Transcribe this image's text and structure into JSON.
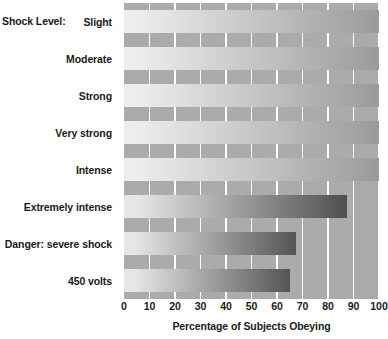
{
  "chart_data": {
    "type": "bar",
    "orientation": "horizontal",
    "title": "",
    "xlabel": "Percentage of Subjects Obeying",
    "ylabel": "Shock Level:",
    "categories": [
      "Slight",
      "Moderate",
      "Strong",
      "Very strong",
      "Intense",
      "Extremely intense",
      "Danger: severe shock",
      "450 volts"
    ],
    "values": [
      100,
      100,
      100,
      100,
      100,
      87.5,
      67.5,
      65
    ],
    "xlim": [
      0,
      100
    ],
    "xticks": [
      0,
      10,
      20,
      30,
      40,
      50,
      60,
      70,
      80,
      90,
      100
    ],
    "xtick_labels": [
      "0",
      "10",
      "20",
      "30",
      "40",
      "50",
      "60",
      "70",
      "80",
      "90",
      "100"
    ],
    "grid": true,
    "legend": false,
    "colors": {
      "plot_background": "#ababab",
      "gridline": "#ffffff",
      "bar_gradient_start": "#e8e8e8",
      "bar_gradient_end": "#4d4d4d",
      "text": "#1a1a1a",
      "page_background": "#ffffff"
    }
  }
}
